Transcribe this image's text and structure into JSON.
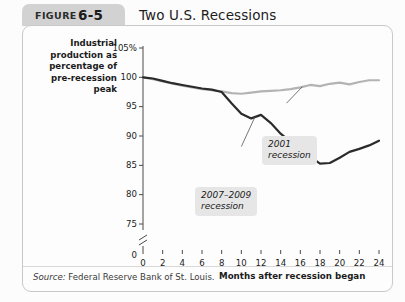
{
  "header": {
    "figure_word": "FIGURE",
    "figure_number": "6-5",
    "title": "Two U.S. Recessions"
  },
  "source": {
    "prefix": "Source:",
    "text": "Federal Reserve Bank of St. Louis."
  },
  "colors": {
    "series_2001": "#b3b3b3",
    "series_2007": "#2b2b2b",
    "callout_bg": "#e6e6e6",
    "panel_border": "#c9c9c9",
    "figure_tab": "#d2d2d2"
  },
  "annotations": [
    {
      "name": "2001-recession-callout",
      "line1": "2001",
      "line2": "recession"
    },
    {
      "name": "2007-2009-recession-callout",
      "line1": "2007–2009",
      "line2": "recession"
    }
  ],
  "chart_data": {
    "type": "line",
    "title": "Two U.S. Recessions",
    "xlabel": "Months after recession began",
    "ylabel": "Industrial production as percentage of pre-recession peak",
    "ylabel_lines": [
      "Industrial",
      "production as",
      "percentage of",
      "pre-recession",
      "peak"
    ],
    "xlim": [
      0,
      24
    ],
    "ylim": [
      73,
      106
    ],
    "axis_break": true,
    "axis_break_between": [
      73,
      0
    ],
    "grid": false,
    "legend": "none (inline callout labels)",
    "xticks": [
      0,
      2,
      4,
      6,
      8,
      10,
      12,
      14,
      16,
      18,
      20,
      22,
      24
    ],
    "xticklabels": [
      "0",
      "2",
      "4",
      "6",
      "8",
      "10",
      "12",
      "14",
      "16",
      "18",
      "20",
      "22",
      "24"
    ],
    "yticks": [
      75,
      80,
      85,
      90,
      95,
      100,
      105
    ],
    "yticklabels": [
      "75",
      "80",
      "85",
      "90",
      "95",
      "100",
      "105%"
    ],
    "y_origin_label": "0",
    "x": [
      0,
      1,
      2,
      3,
      4,
      5,
      6,
      7,
      8,
      9,
      10,
      11,
      12,
      13,
      14,
      15,
      16,
      17,
      18,
      19,
      20,
      21,
      22,
      23,
      24
    ],
    "series": [
      {
        "name": "2001 recession",
        "color": "#b3b3b3",
        "values": [
          100.0,
          99.7,
          99.3,
          98.9,
          98.6,
          98.3,
          98.0,
          97.8,
          97.6,
          97.3,
          97.2,
          97.4,
          97.6,
          97.7,
          97.8,
          98.0,
          98.3,
          98.7,
          98.5,
          98.9,
          99.1,
          98.8,
          99.2,
          99.5,
          99.5
        ]
      },
      {
        "name": "2007–2009 recession",
        "color": "#2b2b2b",
        "values": [
          100.0,
          99.8,
          99.4,
          99.0,
          98.7,
          98.4,
          98.1,
          97.9,
          97.5,
          95.6,
          93.8,
          93.0,
          93.6,
          92.2,
          90.4,
          89.0,
          87.6,
          86.5,
          85.3,
          85.4,
          86.3,
          87.3,
          87.8,
          88.4,
          89.2
        ]
      }
    ]
  }
}
